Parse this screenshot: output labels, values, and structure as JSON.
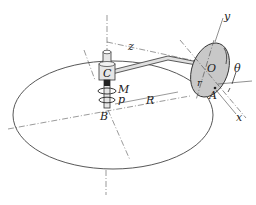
{
  "diagram": {
    "type": "mechanics-3d-figure",
    "labels": {
      "y_axis": "y",
      "z_axis": "z",
      "x_axis": "x",
      "point_o": "O",
      "point_a": "A",
      "point_b": "B",
      "point_c": "C",
      "moment": "M",
      "angular_rate": "p",
      "radius_large": "R",
      "radius_disk": "r",
      "angle": "θ"
    },
    "colors": {
      "line": "#333333",
      "disk_fill": "#c8c8c8",
      "shaft_fill": "#e6e6e6"
    }
  }
}
